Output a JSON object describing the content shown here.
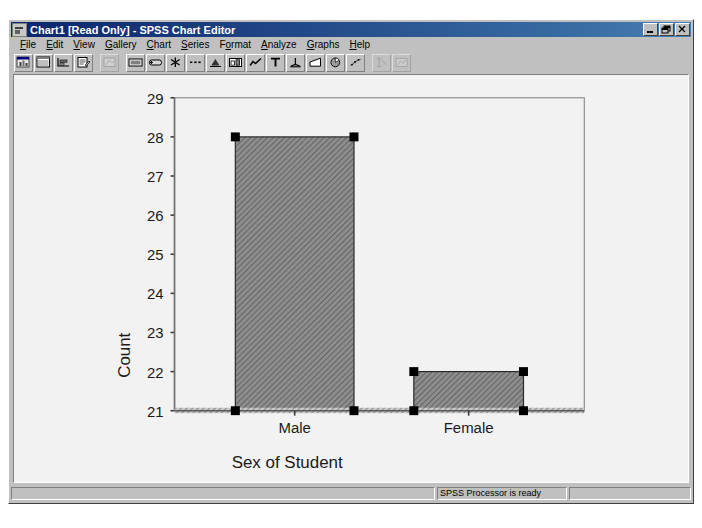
{
  "window": {
    "title": "Chart1 [Read Only] - SPSS Chart Editor",
    "icon": "chart-window-icon",
    "buttons": {
      "minimize": "minimize-button",
      "restore": "restore-button",
      "close": "close-button"
    }
  },
  "menu": {
    "items": [
      {
        "label": "File",
        "accel": "F"
      },
      {
        "label": "Edit",
        "accel": "E"
      },
      {
        "label": "View",
        "accel": "V"
      },
      {
        "label": "Gallery",
        "accel": "G"
      },
      {
        "label": "Chart",
        "accel": "C"
      },
      {
        "label": "Series",
        "accel": "S"
      },
      {
        "label": "Format",
        "accel": "o"
      },
      {
        "label": "Analyze",
        "accel": "A"
      },
      {
        "label": "Graphs",
        "accel": "G"
      },
      {
        "label": "Help",
        "accel": "H"
      }
    ]
  },
  "toolbar": {
    "buttons": [
      {
        "name": "new-chart-window-icon",
        "enabled": true,
        "group": 0
      },
      {
        "name": "chart-options-icon",
        "enabled": true,
        "group": 0
      },
      {
        "name": "axis-properties-icon",
        "enabled": true,
        "group": 0
      },
      {
        "name": "titles-icon",
        "enabled": true,
        "group": 0
      },
      {
        "name": "spin-chart-icon",
        "enabled": false,
        "group": 1
      },
      {
        "name": "bar-style-icon",
        "enabled": true,
        "group": 2
      },
      {
        "name": "bar-label-style-icon",
        "enabled": true,
        "group": 2
      },
      {
        "name": "fill-pattern-icon",
        "enabled": true,
        "group": 2
      },
      {
        "name": "line-style-icon",
        "enabled": true,
        "group": 2
      },
      {
        "name": "marker-style-icon",
        "enabled": true,
        "group": 2
      },
      {
        "name": "bar-chart-icon",
        "enabled": true,
        "group": 2
      },
      {
        "name": "line-chart-icon",
        "enabled": true,
        "group": 2
      },
      {
        "name": "text-style-icon",
        "enabled": true,
        "group": 2
      },
      {
        "name": "axis-scale-icon",
        "enabled": true,
        "group": 2
      },
      {
        "name": "area-chart-icon",
        "enabled": true,
        "group": 2
      },
      {
        "name": "pie-chart-icon",
        "enabled": true,
        "group": 2
      },
      {
        "name": "scatter-chart-icon",
        "enabled": true,
        "group": 2
      },
      {
        "name": "explode-slice-icon",
        "enabled": false,
        "group": 3
      },
      {
        "name": "swap-axes-icon",
        "enabled": false,
        "group": 3
      }
    ]
  },
  "statusbar": {
    "message": "SPSS Processor is ready",
    "pane_mid": "",
    "pane_right": ""
  },
  "chart_data": {
    "type": "bar",
    "title": "",
    "xlabel": "Sex of Student",
    "ylabel": "Count",
    "categories": [
      "Male",
      "Female"
    ],
    "values": [
      28,
      22
    ],
    "ylim": [
      21,
      29
    ],
    "yticks": [
      21,
      22,
      23,
      24,
      25,
      26,
      27,
      28,
      29
    ],
    "ytick_labels": [
      "21",
      "22",
      "23",
      "24",
      "25",
      "26",
      "27",
      "28",
      "29"
    ],
    "grid": false,
    "legend": "none",
    "bar_fill": "#808080",
    "bar_pattern": "diagonal-hatch",
    "bar_border": "#000000",
    "frame": true,
    "frame_color": "#808080",
    "selection": {
      "selected_element": "bars-and-category-axis",
      "handle_color": "#000000",
      "handles_per_bar": 4
    }
  },
  "colors": {
    "window_face": "#c0c0c0",
    "titlebar_start": "#0a246a",
    "titlebar_end": "#4a7fb5",
    "canvas": "#f2f2f2",
    "axis": "#808080",
    "text": "#000000"
  }
}
